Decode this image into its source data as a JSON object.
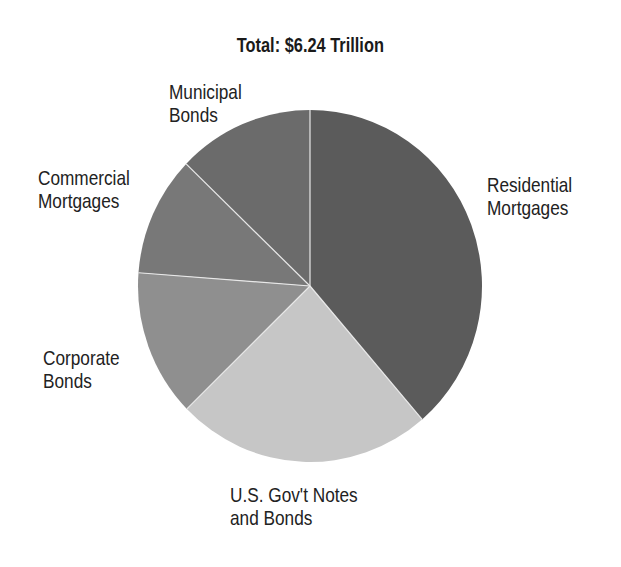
{
  "chart_data": {
    "type": "pie",
    "title": "Total: $6.24 Trillion",
    "center": [
      310,
      286
    ],
    "radius_x": 172,
    "radius_y": 176,
    "start_angle_deg": 0,
    "direction": "clockwise",
    "slices": [
      {
        "label": "Residential Mortgages",
        "percent": 38.7,
        "color": "#5b5b5b",
        "label_lines": [
          "Residential",
          "Mortgages"
        ],
        "label_pos": [
          487,
          173
        ]
      },
      {
        "label": "U.S. Gov't Notes and Bonds",
        "percent": 24.0,
        "color": "#c6c6c6",
        "label_lines": [
          "U.S. Gov't Notes",
          "and Bonds"
        ],
        "label_pos": [
          230,
          483
        ]
      },
      {
        "label": "Corporate Bonds",
        "percent": 13.5,
        "color": "#8f8f8f",
        "label_lines": [
          "Corporate",
          "Bonds"
        ],
        "label_pos": [
          43,
          346
        ]
      },
      {
        "label": "Commercial Mortgages",
        "percent": 11.0,
        "color": "#787878",
        "label_lines": [
          "Commercial",
          "Mortgages"
        ],
        "label_pos": [
          38,
          166
        ]
      },
      {
        "label": "Municipal Bonds",
        "percent": 12.8,
        "color": "#6b6b6b",
        "label_lines": [
          "Municipal",
          "Bonds"
        ],
        "label_pos": [
          169,
          80
        ]
      }
    ],
    "total": "$6.24 Trillion",
    "legend": "none (direct labels)"
  }
}
